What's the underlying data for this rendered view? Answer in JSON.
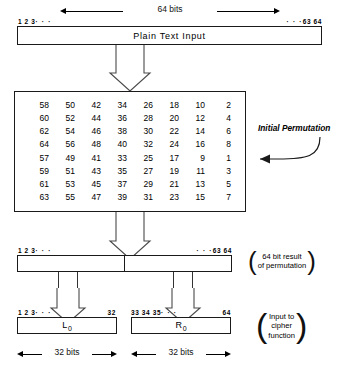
{
  "diagram": {
    "top_dimension": {
      "label": "64 bits"
    },
    "plain_text_box": {
      "label": "Plain Text Input",
      "bits_left": "1 2 3",
      "bits_left_dots": "· · ·",
      "bits_right_dots": "· · ·",
      "bits_right": "63 64"
    },
    "permutation_table": {
      "callout": "Initial Permutation",
      "rows": [
        [
          58,
          50,
          42,
          34,
          26,
          18,
          10,
          2
        ],
        [
          60,
          52,
          44,
          36,
          28,
          20,
          12,
          4
        ],
        [
          62,
          54,
          46,
          38,
          30,
          22,
          14,
          6
        ],
        [
          64,
          56,
          48,
          40,
          32,
          24,
          16,
          8
        ],
        [
          57,
          49,
          41,
          33,
          25,
          17,
          9,
          1
        ],
        [
          59,
          51,
          43,
          35,
          27,
          19,
          11,
          3
        ],
        [
          61,
          53,
          45,
          37,
          29,
          21,
          13,
          5
        ],
        [
          63,
          55,
          47,
          39,
          31,
          23,
          15,
          7
        ]
      ]
    },
    "result_box": {
      "bits_left": "1 2 3",
      "bits_left_dots": "· · ·",
      "bits_right_dots": "· · ·",
      "bits_right": "63 64",
      "note_line1": "64 bit result",
      "note_line2": "of permutation"
    },
    "left_half": {
      "label": "L",
      "subscript": "0",
      "bits_left": "1 2 3",
      "bits_left_dots": "· · ·",
      "bits_right": "32",
      "dimension": "32 bits"
    },
    "right_half": {
      "label": "R",
      "subscript": "0",
      "bits_left": "33 34 35",
      "bits_left_dots": "· · ·",
      "bits_right": "64",
      "dimension": "32 bits"
    },
    "cipher_note": {
      "line1": "Input to",
      "line2": "cipher",
      "line3": "function"
    }
  }
}
